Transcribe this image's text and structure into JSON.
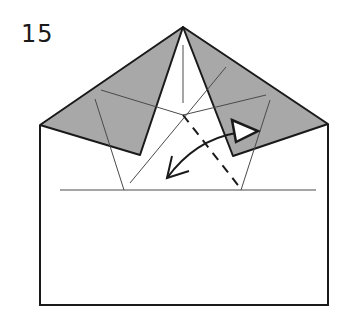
{
  "diagram": {
    "step_number": "15",
    "type": "origami-folding-step",
    "colors": {
      "paper_colored_side": "#a8a8a8",
      "paper_white_side": "#ffffff",
      "line": "#1a1a1a",
      "thin_line": "#4a4a4a"
    },
    "elements": {
      "outline": "paper-rectangle-with-pointed-top",
      "left_flap": "shaded-flap-left",
      "right_flap": "shaded-flap-right",
      "valley_fold": "dashed-valley-fold-line",
      "fold_arrow": "curved-arrow-fold-over",
      "push_arrow": "hollow-push-arrow"
    }
  }
}
